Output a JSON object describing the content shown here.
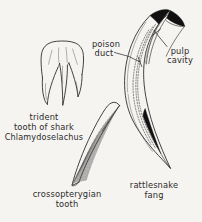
{
  "figure": {
    "background_color": "#f6f4f1",
    "ink_color": "#242424",
    "text_color": "#2b2b2b",
    "accent_black": "#111111",
    "width": 202,
    "height": 222
  },
  "callouts": {
    "poison_duct_line1": "poison",
    "poison_duct_line2": "duct",
    "pulp_cavity_line1": "pulp",
    "pulp_cavity_line2": "cavity"
  },
  "captions": {
    "trident_line1": "trident",
    "trident_line2": "tooth of shark",
    "trident_line3": "Chlamydoselachus",
    "crossopterygian_line1": "crossopterygian",
    "crossopterygian_line2": "tooth",
    "rattlesnake_line1": "rattlesnake",
    "rattlesnake_line2": "fang"
  },
  "specimens": [
    {
      "id": "trident-tooth",
      "name": "trident tooth of shark Chlamydoselachus",
      "cusp_count": 3
    },
    {
      "id": "crossopterygian-tooth",
      "name": "crossopterygian tooth",
      "feature": "vertical striations"
    },
    {
      "id": "rattlesnake-fang",
      "name": "rattlesnake fang",
      "annotated_parts": [
        "poison duct",
        "pulp cavity"
      ]
    }
  ]
}
